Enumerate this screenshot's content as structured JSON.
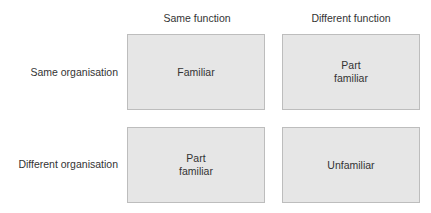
{
  "columns": [
    "Same function",
    "Different function"
  ],
  "rows": [
    "Same organisation",
    "Different organisation"
  ],
  "cells": [
    [
      "Familiar",
      "Part\nfamiliar"
    ],
    [
      "Part\nfamiliar",
      "Unfamiliar"
    ]
  ],
  "colors": {
    "cell_fill": "#e6e6e6",
    "cell_border": "#bdbdbd",
    "text": "#333333"
  }
}
